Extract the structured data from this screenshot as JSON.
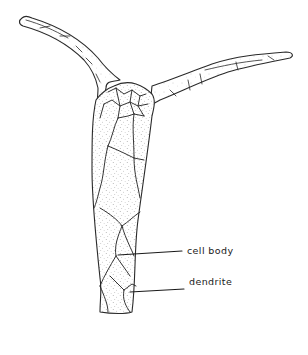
{
  "figure": {
    "type": "line-drawing",
    "labels": {
      "cell_body": "cell body",
      "dendrite": "dendrite"
    },
    "colors": {
      "background": "#ffffff",
      "ink": "#2a2a2a",
      "stipple": "#6a6a6a"
    }
  }
}
